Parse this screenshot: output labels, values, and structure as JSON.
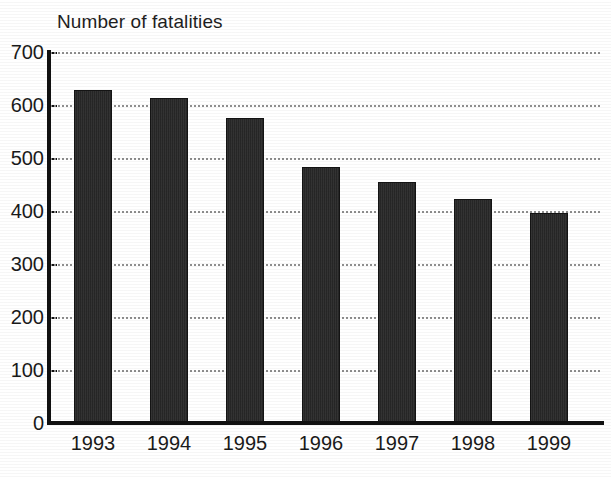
{
  "chart_data": {
    "type": "bar",
    "title": "Number of fatalities",
    "xlabel": "",
    "ylabel": "",
    "categories": [
      "1993",
      "1994",
      "1995",
      "1996",
      "1997",
      "1998",
      "1999"
    ],
    "values": [
      628,
      613,
      576,
      483,
      455,
      423,
      396
    ],
    "series": [
      {
        "name": "Number of fatalities",
        "values": [
          628,
          613,
          576,
          483,
          455,
          423,
          396
        ]
      }
    ],
    "ylim": [
      0,
      700
    ],
    "ytick_labels": [
      "0",
      "100",
      "200",
      "300",
      "400",
      "500",
      "600",
      "700"
    ],
    "ytick_values": [
      0,
      100,
      200,
      300,
      400,
      500,
      600,
      700
    ],
    "grid": true,
    "grid_style": "dotted-horizontal",
    "legend": false,
    "legend_position": "none",
    "bar_color": "#2e2e2e",
    "grid_color": "#8e8e8e",
    "axis_color": "#111111",
    "background_color": "#ffffff"
  }
}
